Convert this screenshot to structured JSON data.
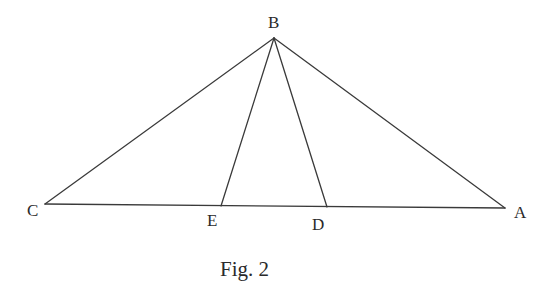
{
  "figure": {
    "caption": "Fig. 2",
    "stroke_color": "#3a3a3a",
    "background": "#ffffff"
  },
  "points": {
    "A": {
      "label": "A",
      "x": 505,
      "y": 208
    },
    "B": {
      "label": "B",
      "x": 274,
      "y": 38
    },
    "C": {
      "label": "C",
      "x": 45,
      "y": 204
    },
    "D": {
      "label": "D",
      "x": 327,
      "y": 207
    },
    "E": {
      "label": "E",
      "x": 221,
      "y": 206
    }
  },
  "segments": [
    {
      "from": "B",
      "to": "C",
      "name": "BC"
    },
    {
      "from": "B",
      "to": "A",
      "name": "BA"
    },
    {
      "from": "C",
      "to": "A",
      "name": "CA"
    },
    {
      "from": "B",
      "to": "E",
      "name": "BE"
    },
    {
      "from": "B",
      "to": "D",
      "name": "BD"
    }
  ]
}
